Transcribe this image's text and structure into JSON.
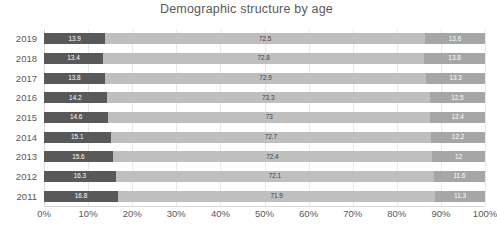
{
  "chart_data": {
    "type": "bar",
    "orientation": "horizontal",
    "stacked": true,
    "normalized_percent": true,
    "title": "Demographic structure by age",
    "xlabel": "",
    "ylabel": "",
    "xlim": [
      0,
      100
    ],
    "xticks": [
      0,
      10,
      20,
      30,
      40,
      50,
      60,
      70,
      80,
      90,
      100
    ],
    "xtick_labels": [
      "0%",
      "10%",
      "20%",
      "30%",
      "40%",
      "50%",
      "60%",
      "70%",
      "80%",
      "90%",
      "100%"
    ],
    "grid": true,
    "legend": "none",
    "categories": [
      "2019",
      "2018",
      "2017",
      "2016",
      "2015",
      "2014",
      "2013",
      "2012",
      "2011"
    ],
    "series": [
      {
        "name": "young",
        "color": "#595959",
        "values": [
          13.9,
          13.4,
          13.8,
          14.2,
          14.6,
          15.1,
          15.6,
          16.3,
          16.8
        ],
        "labels": [
          "13.9",
          "13.4",
          "13.8",
          "14.2",
          "14.6",
          "15.1",
          "15.6",
          "16.3",
          "16.8"
        ]
      },
      {
        "name": "working-age",
        "color": "#bfbfbf",
        "values": [
          72.5,
          72.8,
          72.9,
          73.3,
          73,
          72.7,
          72.4,
          72.1,
          71.9
        ],
        "labels": [
          "72.5",
          "72.8",
          "72.9",
          "73.3",
          "73",
          "72.7",
          "72.4",
          "72.1",
          "71.9"
        ]
      },
      {
        "name": "elderly",
        "color": "#a6a6a6",
        "values": [
          13.6,
          13.8,
          13.3,
          12.5,
          12.4,
          12.2,
          12.0,
          11.6,
          11.3
        ],
        "labels": [
          "13.6",
          "13.8",
          "13.3",
          "12.5",
          "12.4",
          "12.2",
          "12",
          "11.6",
          "11.3"
        ]
      }
    ]
  },
  "colors": {
    "segment_a": "#595959",
    "segment_b": "#bfbfbf",
    "segment_c": "#a6a6a6",
    "gridline": "#e8e8e8",
    "text": "#595959",
    "background": "#ffffff"
  }
}
